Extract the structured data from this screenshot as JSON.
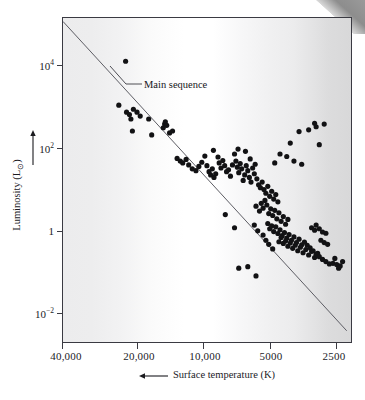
{
  "figure": {
    "kind": "hertzsprung-russell-diagram",
    "corner_artifact": "page-curl-wedge"
  },
  "annotation": {
    "main_sequence_label": "Main sequence"
  },
  "axes": {
    "x_title_text": "Surface temperature (K)",
    "x_arrow_icon": "left-arrow-icon",
    "y_title_text": "Luminosity (L",
    "y_title_sun_symbol": "⊙",
    "y_title_text_tail": ")",
    "y_arrow_icon": "up-arrow-icon",
    "x_tick_labels": [
      "40,000",
      "20,000",
      "10,000",
      "5000",
      "2500"
    ],
    "y_tick_labels": [
      "10⁴",
      "10²",
      "1",
      "10⁻²"
    ]
  },
  "colors": {
    "frame": "#3a3a42",
    "dot": "#121214",
    "main_sequence_line": "#5c5c63",
    "text": "#1b1b1f",
    "band_left": "#ececed",
    "band_center": "#ffffff",
    "band_right": "#d8d8d9",
    "corner_wedge": "#8d8d8d"
  },
  "chart_data": {
    "type": "scatter",
    "title": "",
    "xlabel": "Surface temperature (K)",
    "ylabel": "Luminosity (L⊙)",
    "xscale": "log-reversed",
    "yscale": "log",
    "xlim": [
      40000,
      2300
    ],
    "ylim": [
      0.0025,
      60000
    ],
    "grid": false,
    "legend": null,
    "xticks": [
      40000,
      20000,
      10000,
      5000,
      2500
    ],
    "xticklabels": [
      "40,000",
      "20,000",
      "10,000",
      "5000",
      "2500"
    ],
    "yticks": [
      10000,
      100,
      1,
      0.01
    ],
    "yticklabels": [
      "10⁴",
      "10²",
      "1",
      "10⁻²"
    ],
    "annotations": [
      {
        "text": "Main sequence",
        "target_x": 21000,
        "target_y": 900,
        "label_x": 12500,
        "label_y": 2600
      }
    ],
    "series": [
      {
        "name": "main sequence fit line",
        "type": "line",
        "x": [
          40000,
          2400
        ],
        "y": [
          50000,
          0.0045
        ]
      },
      {
        "name": "stars",
        "type": "scatter",
        "marker": "filled-circle",
        "points_xy": [
          [
            21500,
            6200
          ],
          [
            23000,
            620
          ],
          [
            21300,
            430
          ],
          [
            20700,
            380
          ],
          [
            20400,
            300
          ],
          [
            19900,
            500
          ],
          [
            19200,
            430
          ],
          [
            18600,
            350
          ],
          [
            20100,
            160
          ],
          [
            17100,
            300
          ],
          [
            16600,
            130
          ],
          [
            14800,
            190
          ],
          [
            14600,
            230
          ],
          [
            14500,
            260
          ],
          [
            14300,
            215
          ],
          [
            13900,
            145
          ],
          [
            13500,
            160
          ],
          [
            12900,
            38
          ],
          [
            12500,
            33
          ],
          [
            12200,
            30
          ],
          [
            11800,
            36
          ],
          [
            11500,
            27
          ],
          [
            11100,
            22
          ],
          [
            10700,
            20
          ],
          [
            10400,
            25
          ],
          [
            10100,
            31
          ],
          [
            9800,
            43
          ],
          [
            9600,
            26
          ],
          [
            9400,
            19
          ],
          [
            9250,
            16
          ],
          [
            9100,
            22
          ],
          [
            8950,
            14
          ],
          [
            8800,
            17
          ],
          [
            9000,
            58
          ],
          [
            8600,
            41
          ],
          [
            8500,
            30
          ],
          [
            8350,
            23
          ],
          [
            8200,
            34
          ],
          [
            8050,
            26
          ],
          [
            7900,
            19
          ],
          [
            7750,
            21
          ],
          [
            7600,
            15
          ],
          [
            7450,
            27
          ],
          [
            7300,
            48
          ],
          [
            7200,
            33
          ],
          [
            7100,
            24
          ],
          [
            7000,
            18
          ],
          [
            6900,
            29
          ],
          [
            6800,
            22
          ],
          [
            6700,
            12
          ],
          [
            6600,
            16
          ],
          [
            6500,
            26
          ],
          [
            6400,
            20
          ],
          [
            6300,
            14
          ],
          [
            6200,
            11
          ],
          [
            6100,
            23
          ],
          [
            6000,
            17
          ],
          [
            7050,
            62
          ],
          [
            6550,
            55
          ],
          [
            6250,
            37
          ],
          [
            5950,
            28
          ],
          [
            5850,
            13
          ],
          [
            5750,
            9.5
          ],
          [
            5650,
            8.2
          ],
          [
            5550,
            11
          ],
          [
            5450,
            7.4
          ],
          [
            5350,
            6.1
          ],
          [
            5250,
            8.8
          ],
          [
            5150,
            5.2
          ],
          [
            5050,
            6.8
          ],
          [
            4950,
            4.5
          ],
          [
            4850,
            5.7
          ],
          [
            4750,
            3.9
          ],
          [
            5900,
            3.1
          ],
          [
            5700,
            2.4
          ],
          [
            5600,
            3.6
          ],
          [
            5500,
            2.8
          ],
          [
            5400,
            4.2
          ],
          [
            5300,
            3.3
          ],
          [
            5200,
            2.1
          ],
          [
            5100,
            2.7
          ],
          [
            5000,
            1.9
          ],
          [
            4900,
            2.5
          ],
          [
            4800,
            1.6
          ],
          [
            4700,
            2.2
          ],
          [
            4600,
            1.4
          ],
          [
            4500,
            1.8
          ],
          [
            4400,
            1.2
          ],
          [
            4300,
            1.55
          ],
          [
            5250,
            1.25
          ],
          [
            5150,
            0.95
          ],
          [
            5050,
            1.1
          ],
          [
            4950,
            0.82
          ],
          [
            4850,
            1.05
          ],
          [
            4750,
            0.74
          ],
          [
            4650,
            0.9
          ],
          [
            4550,
            0.66
          ],
          [
            4450,
            0.78
          ],
          [
            4350,
            0.58
          ],
          [
            4250,
            0.7
          ],
          [
            4150,
            0.52
          ],
          [
            4050,
            0.62
          ],
          [
            3950,
            0.46
          ],
          [
            3850,
            0.55
          ],
          [
            3750,
            0.41
          ],
          [
            4700,
            0.48
          ],
          [
            4600,
            0.6
          ],
          [
            4500,
            0.44
          ],
          [
            4400,
            0.5
          ],
          [
            4300,
            0.38
          ],
          [
            4200,
            0.45
          ],
          [
            4100,
            0.34
          ],
          [
            4000,
            0.4
          ],
          [
            3900,
            0.3
          ],
          [
            3800,
            0.36
          ],
          [
            3700,
            0.27
          ],
          [
            3600,
            0.32
          ],
          [
            3500,
            0.24
          ],
          [
            3400,
            0.29
          ],
          [
            3300,
            0.21
          ],
          [
            3200,
            0.26
          ],
          [
            3650,
            0.47
          ],
          [
            3550,
            0.4
          ],
          [
            3450,
            0.35
          ],
          [
            3350,
            0.3
          ],
          [
            3250,
            0.25
          ],
          [
            3150,
            0.22
          ],
          [
            3050,
            0.19
          ],
          [
            2950,
            0.17
          ],
          [
            2850,
            0.15
          ],
          [
            2750,
            0.155
          ],
          [
            2650,
            0.145
          ],
          [
            2560,
            0.135
          ],
          [
            3100,
            0.52
          ],
          [
            3000,
            0.46
          ],
          [
            2900,
            0.42
          ],
          [
            3400,
            1.0
          ],
          [
            3300,
            0.88
          ],
          [
            3250,
            1.15
          ],
          [
            3150,
            0.95
          ],
          [
            3050,
            0.8
          ],
          [
            2950,
            0.75
          ],
          [
            6000,
            1.15
          ],
          [
            5800,
            0.85
          ],
          [
            5500,
            0.68
          ],
          [
            5350,
            0.52
          ],
          [
            5200,
            0.42
          ],
          [
            5000,
            0.33
          ],
          [
            8000,
            2.0
          ],
          [
            7300,
            1.0
          ],
          [
            7000,
            0.12
          ],
          [
            6400,
            0.13
          ],
          [
            5900,
            0.08
          ],
          [
            3300,
            240
          ],
          [
            3250,
            200
          ],
          [
            3000,
            230
          ],
          [
            3500,
            170
          ],
          [
            3850,
            155
          ],
          [
            4200,
            85
          ],
          [
            3150,
            78
          ],
          [
            4650,
            48
          ],
          [
            4350,
            42
          ],
          [
            4050,
            33
          ],
          [
            3750,
            28
          ],
          [
            4900,
            30
          ],
          [
            2600,
            0.12
          ],
          [
            2700,
            0.2
          ],
          [
            2500,
            0.17
          ]
        ]
      }
    ]
  }
}
